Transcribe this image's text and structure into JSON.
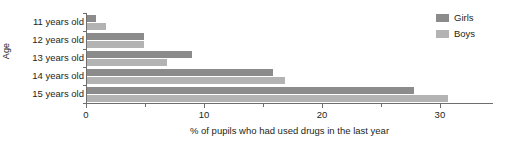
{
  "chart_data": {
    "type": "bar",
    "orientation": "horizontal",
    "title": "",
    "xlabel": "% of pupils who had used drugs in the last year",
    "ylabel": "Age",
    "categories": [
      "11 years old",
      "12 years old",
      "13 years old",
      "14 years old",
      "15 years old"
    ],
    "series": [
      {
        "name": "Girls",
        "color": "#8b8b8b",
        "values": [
          0.8,
          4.8,
          8.9,
          15.8,
          27.7
        ]
      },
      {
        "name": "Boys",
        "color": "#b3b3b3",
        "values": [
          1.6,
          4.8,
          6.8,
          16.8,
          30.6
        ]
      }
    ],
    "xlim": [
      0,
      34.5
    ],
    "x_major_ticks": [
      0,
      10,
      20,
      30
    ],
    "x_minor_ticks": [
      5,
      15,
      25
    ],
    "x_tick_labels": [
      "0",
      "10",
      "20",
      "30"
    ],
    "grid": false,
    "legend_position": "top-right",
    "legend_entries": [
      "Girls",
      "Boys"
    ]
  },
  "legend": {
    "girls_label": "Girls",
    "boys_label": "Boys"
  },
  "axes": {
    "y_title": "Age",
    "x_title": "% of pupils who had used drugs in the last year"
  }
}
